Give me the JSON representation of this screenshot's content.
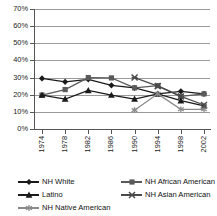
{
  "chart_data": {
    "type": "line",
    "title": "",
    "xlabel": "",
    "ylabel": "",
    "categories": [
      "1974",
      "1978",
      "1982",
      "1986",
      "1990",
      "1994",
      "1998",
      "2002"
    ],
    "ylim": [
      0,
      70
    ],
    "ytick_values": [
      0,
      10,
      20,
      30,
      40,
      50,
      60,
      70
    ],
    "ytick_labels": [
      "0%",
      "10%",
      "20%",
      "30%",
      "40%",
      "50%",
      "60%",
      "70%"
    ],
    "grid": true,
    "legend_position": "bottom",
    "series": [
      {
        "name": "NH White",
        "marker": "diamond",
        "color": "#1a1a1a",
        "values": [
          29.5,
          27.5,
          29.0,
          25.5,
          24.0,
          20.5,
          22.0,
          20.5
        ]
      },
      {
        "name": "NH African American",
        "marker": "square",
        "color": "#5a5a5a",
        "values": [
          19.8,
          23.0,
          30.0,
          29.8,
          24.0,
          25.3,
          19.0,
          20.5
        ]
      },
      {
        "name": "Latino",
        "marker": "triangle",
        "color": "#1a1a1a",
        "values": [
          19.8,
          17.5,
          22.5,
          19.8,
          17.5,
          20.5,
          16.5,
          13.5
        ]
      },
      {
        "name": "NH Asian American",
        "marker": "x",
        "color": "#4a4a4a",
        "values": [
          null,
          null,
          null,
          null,
          30.0,
          25.0,
          19.0,
          14.0
        ]
      },
      {
        "name": "NH Native American",
        "marker": "asterisk",
        "color": "#8a8a8a",
        "values": [
          null,
          null,
          null,
          null,
          11.0,
          20.5,
          11.5,
          11.5
        ]
      }
    ]
  },
  "legend": {
    "items": [
      {
        "label": "NH White",
        "marker": "diamond"
      },
      {
        "label": "NH African American",
        "marker": "square"
      },
      {
        "label": "Latino",
        "marker": "triangle"
      },
      {
        "label": "NH Asian American",
        "marker": "x"
      },
      {
        "label": "NH Native American",
        "marker": "asterisk"
      }
    ]
  }
}
